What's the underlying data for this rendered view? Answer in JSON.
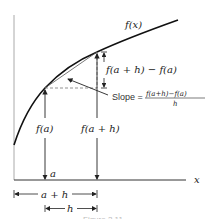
{
  "diagram": {
    "curve_label": "f(x)",
    "x_axis_label": "x",
    "point_a_label": "a",
    "fa_label": "f(a)",
    "fah_label": "f(a + h)",
    "rise_label": "f(a + h) − f(a)",
    "slope_prefix": "Slope =",
    "slope_numerator": "f(a+h)−f(a)",
    "slope_denominator": "h",
    "dim_a_plus_h": "a + h",
    "dim_h": "h",
    "caption": "Figure 2.11"
  },
  "colors": {
    "line": "#222222",
    "dashed": "#777777",
    "caption": "#bbbbbb"
  }
}
